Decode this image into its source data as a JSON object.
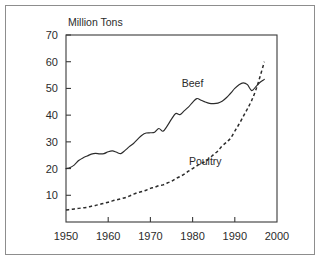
{
  "chart_data": {
    "type": "line",
    "title": "",
    "subtitle": "",
    "xlabel": "",
    "ylabel": "Million Tons",
    "xlim": [
      1950,
      2000
    ],
    "ylim": [
      0,
      70
    ],
    "grid": false,
    "legend_position": "inline-annotation",
    "x_ticks": [
      "1950",
      "1960",
      "1970",
      "1980",
      "1990",
      "2000"
    ],
    "x_tick_values": [
      1950,
      1960,
      1970,
      1980,
      1990,
      2000
    ],
    "y_ticks": [
      "10",
      "20",
      "30",
      "40",
      "50",
      "60",
      "70"
    ],
    "y_tick_values": [
      10,
      20,
      30,
      40,
      50,
      60,
      70
    ],
    "annotations": [
      {
        "text": "Beef",
        "x": 1980,
        "y": 50.5
      },
      {
        "text": "Poultry",
        "x": 1983,
        "y": 21.5
      }
    ],
    "series": [
      {
        "name": "Beef",
        "style": "solid",
        "color": "#2b2b2b",
        "x": [
          1950,
          1951,
          1952,
          1953,
          1954,
          1955,
          1956,
          1957,
          1958,
          1959,
          1960,
          1961,
          1962,
          1963,
          1964,
          1965,
          1966,
          1967,
          1968,
          1969,
          1970,
          1971,
          1972,
          1973,
          1974,
          1975,
          1976,
          1977,
          1978,
          1979,
          1980,
          1981,
          1982,
          1983,
          1984,
          1985,
          1986,
          1987,
          1988,
          1989,
          1990,
          1991,
          1992,
          1993,
          1994,
          1995,
          1996,
          1997
        ],
        "values": [
          20.0,
          20.4,
          21.4,
          23.0,
          24.0,
          24.7,
          25.4,
          25.7,
          25.5,
          25.6,
          26.3,
          26.6,
          26.1,
          25.6,
          26.8,
          28.2,
          29.4,
          31.0,
          32.5,
          33.3,
          33.4,
          33.6,
          35.0,
          34.0,
          36.0,
          38.5,
          40.6,
          40.2,
          41.6,
          43.0,
          44.8,
          46.2,
          45.6,
          44.9,
          44.4,
          44.3,
          44.5,
          45.2,
          46.5,
          48.2,
          50.0,
          51.4,
          52.1,
          51.4,
          49.2,
          50.7,
          52.3,
          53.4
        ]
      },
      {
        "name": "Poultry",
        "style": "dashed",
        "color": "#2b2b2b",
        "x": [
          1950,
          1951,
          1952,
          1953,
          1954,
          1955,
          1956,
          1957,
          1958,
          1959,
          1960,
          1961,
          1962,
          1963,
          1964,
          1965,
          1966,
          1967,
          1968,
          1969,
          1970,
          1971,
          1972,
          1973,
          1974,
          1975,
          1976,
          1977,
          1978,
          1979,
          1980,
          1981,
          1982,
          1983,
          1984,
          1985,
          1986,
          1987,
          1988,
          1989,
          1990,
          1991,
          1992,
          1993,
          1994,
          1995,
          1996,
          1997
        ],
        "values": [
          4.5,
          4.7,
          4.9,
          5.1,
          5.3,
          5.5,
          5.9,
          6.2,
          6.6,
          7.0,
          7.4,
          7.9,
          8.3,
          8.7,
          9.1,
          9.7,
          10.4,
          11.0,
          11.4,
          11.9,
          12.6,
          13.0,
          13.6,
          13.9,
          14.6,
          15.2,
          16.2,
          17.0,
          17.9,
          19.0,
          20.0,
          21.0,
          21.9,
          22.6,
          23.9,
          25.3,
          26.6,
          28.5,
          29.8,
          31.4,
          34.0,
          36.6,
          39.5,
          42.4,
          45.5,
          49.5,
          54.5,
          60.0
        ]
      }
    ]
  },
  "figure": {
    "y_axis_title": "Million Tons"
  }
}
